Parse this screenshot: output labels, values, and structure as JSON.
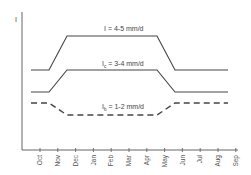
{
  "chart_data": {
    "type": "line",
    "title": "",
    "xlabel": "",
    "ylabel": "I",
    "categories": [
      "Oct",
      "Nov",
      "Dec",
      "Jan",
      "Feb",
      "Mar",
      "Apr",
      "May",
      "Jun",
      "Jul",
      "Aug",
      "Sep"
    ],
    "grid": false,
    "legend": "inline annotations",
    "series": [
      {
        "name": "I",
        "annotation": "I = 4-5 mm/d",
        "style": "solid",
        "description": "Low Oct–Nov, rises Nov–Dec, high plateau Dec–May, falls May–Jun, low Jun–Sep",
        "points": [
          [
            "Oct",
            0.0
          ],
          [
            "Nov",
            0.0
          ],
          [
            "Dec",
            1.0
          ],
          [
            "May",
            1.0
          ],
          [
            "Jun",
            0.0
          ],
          [
            "Sep",
            0.0
          ]
        ]
      },
      {
        "name": "I_c",
        "annotation": "I_c = 3-4 mm/d",
        "style": "solid",
        "description": "Low Oct–Nov, rises Nov–Dec, plateau Dec–May, falls May–Jun, low Jun–Sep",
        "points": [
          [
            "Oct",
            0.0
          ],
          [
            "Nov",
            0.0
          ],
          [
            "Dec",
            1.0
          ],
          [
            "May",
            1.0
          ],
          [
            "Jun",
            0.0
          ],
          [
            "Sep",
            0.0
          ]
        ]
      },
      {
        "name": "I_b",
        "annotation": "I_b = 1-2 mm/d",
        "style": "dashed",
        "description": "Higher Oct–Nov, dips Nov–Dec, low plateau Dec–May, rises May–Jun, higher Jun–Sep",
        "points": [
          [
            "Oct",
            1.0
          ],
          [
            "Nov",
            1.0
          ],
          [
            "Dec",
            0.0
          ],
          [
            "May",
            0.0
          ],
          [
            "Jun",
            1.0
          ],
          [
            "Sep",
            1.0
          ]
        ]
      }
    ]
  },
  "axis": {
    "y_label": "I",
    "x_ticks": [
      "Oct",
      "Nov",
      "Dec",
      "Jan",
      "Feb",
      "Mar",
      "Apr",
      "May",
      "Jun",
      "Jul",
      "Aug",
      "Sep"
    ]
  },
  "annotations": {
    "I_main": "I",
    "I_rest": " = 4-5 mm/d",
    "Ic_main": "I",
    "Ic_sub": "c",
    "Ic_rest": " = 3-4 mm/d",
    "Ib_main": "I",
    "Ib_sub": "b",
    "Ib_rest": " = 1-2 mm/d"
  },
  "colors": {
    "line": "#444444",
    "axis": "#555555",
    "text": "#444444"
  }
}
